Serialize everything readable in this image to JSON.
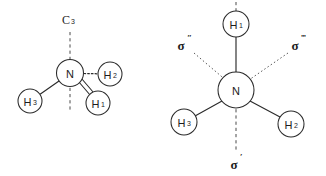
{
  "figure": {
    "background_color": "#ffffff",
    "line_color": "#2b2b2b",
    "width": 326,
    "height": 176
  },
  "left_structure": {
    "name": "ammonia-c3-axis-view",
    "center_atom": {
      "symbol": "N",
      "label": "N",
      "cx": 70,
      "cy": 73,
      "r": 13.5
    },
    "substituents": [
      {
        "id": "h1",
        "symbol": "H",
        "subscript": "1",
        "cx": 98,
        "cy": 103,
        "r": 12,
        "bond_style": "wedge"
      },
      {
        "id": "h2",
        "symbol": "H",
        "subscript": "2",
        "cx": 110,
        "cy": 74,
        "r": 12,
        "bond_style": "hash"
      },
      {
        "id": "h3",
        "symbol": "H",
        "subscript": "3",
        "cx": 30,
        "cy": 101,
        "r": 12,
        "bond_style": "plain"
      }
    ],
    "axis": {
      "id": "c3-axis",
      "label": "C",
      "subscript": "3",
      "style": "dashed",
      "label_x": 66,
      "label_y": 20,
      "x": 70,
      "y_top": 32,
      "y_bottom": 112
    }
  },
  "right_structure": {
    "name": "ammonia-mirror-planes-view",
    "center_atom": {
      "symbol": "N",
      "label": "N",
      "cx": 236,
      "cy": 90,
      "r": 18
    },
    "substituents": [
      {
        "id": "h1",
        "symbol": "H",
        "subscript": "1",
        "cx": 236,
        "cy": 24,
        "r": 13,
        "bond_style": "plain"
      },
      {
        "id": "h2",
        "symbol": "H",
        "subscript": "2",
        "cx": 291,
        "cy": 124,
        "r": 13,
        "bond_style": "plain"
      },
      {
        "id": "h3",
        "symbol": "H",
        "subscript": "3",
        "cx": 184,
        "cy": 122,
        "r": 13,
        "bond_style": "plain"
      }
    ],
    "planes": [
      {
        "id": "sigma-double-prime",
        "label": "σ",
        "primes": "″",
        "label_x": 181,
        "label_y": 45,
        "line": {
          "x1": 194,
          "y1": 53,
          "x2": 228,
          "y2": 82
        },
        "style": "dotted"
      },
      {
        "id": "sigma-triple-prime",
        "label": "σ",
        "primes": "‴",
        "label_x": 295,
        "label_y": 45,
        "line": {
          "x1": 288,
          "y1": 53,
          "x2": 246,
          "y2": 82
        },
        "style": "dotted"
      },
      {
        "id": "sigma-prime",
        "label": "σ",
        "primes": "′",
        "label_x": 234,
        "label_y": 164,
        "line": {
          "x1": 236,
          "y1": 108,
          "x2": 236,
          "y2": 152
        },
        "style": "dashed"
      }
    ],
    "vertical_axis": {
      "id": "vertical-dashed-through-h1",
      "x": 236,
      "y_top": 2,
      "y_bottom": 11,
      "style": "dashed"
    }
  }
}
